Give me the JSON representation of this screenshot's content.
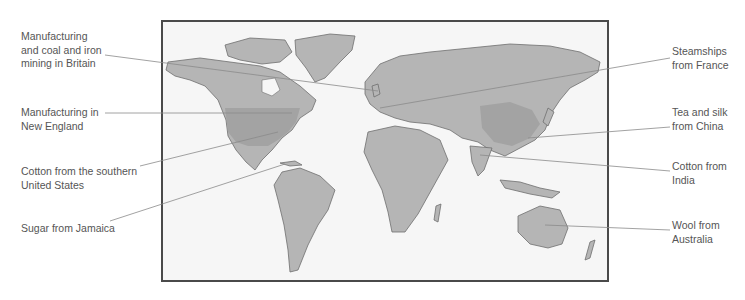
{
  "diagram": {
    "type": "annotated-world-map",
    "map": {
      "projection": "world",
      "land_color": "#b5b5b5",
      "highlight_color": "#a3a3a3",
      "ocean_color": "#f6f6f6",
      "border_color": "#4a4a4a"
    },
    "labels_left": [
      {
        "id": "britain",
        "lines": [
          "Manufacturing",
          "and coal and iron",
          "mining in Britain"
        ]
      },
      {
        "id": "new-england",
        "lines": [
          "Manufacturing in",
          "New England"
        ]
      },
      {
        "id": "southern-us",
        "lines": [
          "Cotton from the southern",
          "United States"
        ]
      },
      {
        "id": "jamaica",
        "lines": [
          "Sugar from Jamaica"
        ]
      }
    ],
    "labels_right": [
      {
        "id": "france",
        "lines": [
          "Steamships",
          "from France"
        ]
      },
      {
        "id": "china",
        "lines": [
          "Tea and silk",
          "from China"
        ]
      },
      {
        "id": "india",
        "lines": [
          "Cotton from",
          "India"
        ]
      },
      {
        "id": "australia",
        "lines": [
          "Wool from",
          "Australia"
        ]
      }
    ]
  }
}
